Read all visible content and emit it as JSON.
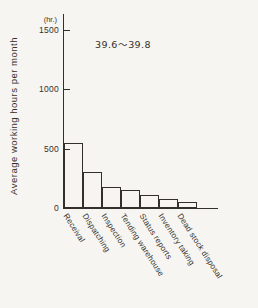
{
  "figure": {
    "paper_color": "#f7f5f1",
    "ink_color": "#33302b"
  },
  "chart_data": {
    "type": "bar",
    "title": "",
    "ylabel": "Average working hours per month",
    "y_unit_label": "(hr.)",
    "annotation": "39.6〜39.8",
    "categories": [
      "Receival",
      "Dispatching",
      "Inspection",
      "Tending warehouse",
      "Status reports",
      "Inventory taking",
      "Dead stock disposal"
    ],
    "values": [
      550,
      305,
      175,
      155,
      110,
      75,
      48
    ],
    "yticks": [
      0,
      500,
      1000,
      1500
    ],
    "ylim": [
      0,
      1630
    ],
    "bar_fill": "none",
    "grid": false,
    "legend_position": "none"
  }
}
